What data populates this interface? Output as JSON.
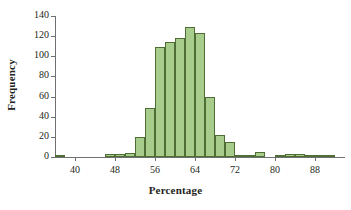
{
  "chart_data": {
    "type": "bar",
    "title": "",
    "xlabel": "Percentage",
    "ylabel": "Frequency",
    "ylim": [
      0,
      140
    ],
    "xlim": [
      36,
      94
    ],
    "grid": false,
    "legend": null,
    "bin_width": 2,
    "ytick_labels": [
      "0",
      "20",
      "40",
      "60",
      "80",
      "100",
      "120",
      "140"
    ],
    "ytick_values": [
      0,
      20,
      40,
      60,
      80,
      100,
      120,
      140
    ],
    "xtick_labels": [
      "40",
      "48",
      "56",
      "64",
      "72",
      "80",
      "88"
    ],
    "xtick_values": [
      40,
      48,
      56,
      64,
      72,
      80,
      88
    ],
    "bin_starts": [
      36,
      38,
      40,
      42,
      44,
      46,
      48,
      50,
      52,
      54,
      56,
      58,
      60,
      62,
      64,
      66,
      68,
      70,
      72,
      74,
      76,
      78,
      80,
      82,
      84,
      86,
      88,
      90,
      92
    ],
    "categories": [
      "36-38",
      "38-40",
      "40-42",
      "42-44",
      "44-46",
      "46-48",
      "48-50",
      "50-52",
      "52-54",
      "54-56",
      "56-58",
      "58-60",
      "60-62",
      "62-64",
      "64-66",
      "66-68",
      "68-70",
      "70-72",
      "72-74",
      "74-76",
      "76-78",
      "78-80",
      "80-82",
      "82-84",
      "84-86",
      "86-88",
      "88-90",
      "90-92",
      "92-94"
    ],
    "values": [
      2,
      0,
      0,
      0,
      0,
      3,
      3,
      4,
      20,
      49,
      109,
      114,
      118,
      129,
      123,
      60,
      22,
      15,
      2,
      2,
      5,
      0,
      2,
      3,
      3,
      2,
      1,
      1,
      0
    ],
    "bar_fill_color": "#a8cc8c",
    "bar_border_color": "#4f6e36",
    "axis_color": "#6f7072",
    "text_color": "#231f20"
  }
}
